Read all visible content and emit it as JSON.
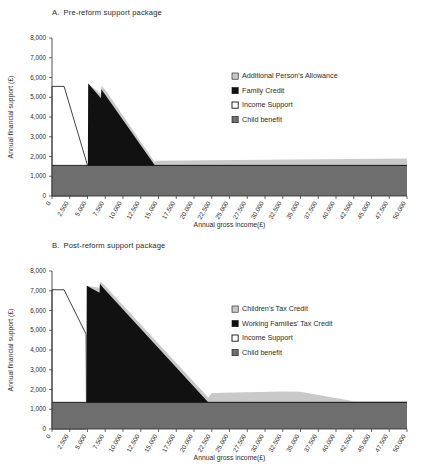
{
  "figure": {
    "width": 421,
    "height": 465,
    "background": "#ffffff"
  },
  "colors": {
    "top_band": "#c9c9c9",
    "main_band": "#111111",
    "income_support": "#ffffff",
    "child_benefit": "#6e6e6e",
    "axis": "#2b2b2b",
    "text": "#2b2b2b",
    "outline": "#111111"
  },
  "panels": [
    {
      "id": "a",
      "letter": "A.",
      "title": "Pre-reform support package",
      "legend": [
        {
          "label": "Additional Person's Allowance",
          "swatch": "#c9c9c9",
          "style": "filled"
        },
        {
          "label": "Family Credit",
          "swatch": "#111111",
          "style": "filled"
        },
        {
          "label": "Income Support",
          "swatch": "#ffffff",
          "style": "outlined"
        },
        {
          "label": "Child benefit",
          "swatch": "#6e6e6e",
          "style": "filled"
        }
      ],
      "chart_data": {
        "type": "area",
        "title": "A. Pre-reform support package",
        "xlabel": "Annual gross income(£)",
        "ylabel": "Annual financial support (£)",
        "xlim": [
          0,
          50000
        ],
        "ylim": [
          0,
          8000
        ],
        "grid": false,
        "legend_position": "right-inside",
        "xticks": [
          0,
          2500,
          5000,
          7500,
          10000,
          12500,
          15000,
          17500,
          20000,
          22500,
          25000,
          27500,
          30000,
          32500,
          35000,
          37500,
          40000,
          42500,
          45000,
          47500,
          50000
        ],
        "xticklabels": [
          "0",
          "2,500",
          "5,000",
          "7,500",
          "10,000",
          "12,500",
          "15,000",
          "17,500",
          "20,000",
          "22,500",
          "25,000",
          "27,500",
          "30,000",
          "32,500",
          "35,000",
          "37,500",
          "40,000",
          "42,500",
          "45,000",
          "47,500",
          "50,000"
        ],
        "yticks": [
          0,
          1000,
          2000,
          3000,
          4000,
          5000,
          6000,
          7000,
          8000
        ],
        "yticklabels": [
          "0",
          "1,000",
          "2,000",
          "3,000",
          "4,000",
          "5,000",
          "6,000",
          "7,000",
          "8,000"
        ],
        "series": [
          {
            "name": "Child benefit",
            "color": "#6e6e6e",
            "x": [
              0,
              50000
            ],
            "values": [
              1550,
              1550
            ]
          },
          {
            "name": "Income Support",
            "color": "#ffffff",
            "x": [
              0,
              1700,
              5000,
              5050
            ],
            "values": [
              5550,
              5550,
              1550,
              1550
            ]
          },
          {
            "name": "Family Credit",
            "color": "#111111",
            "x": [
              5050,
              5100,
              6900,
              6950,
              7450,
              14500,
              50000
            ],
            "values": [
              1550,
              5700,
              4950,
              5400,
              5150,
              1550,
              1550
            ]
          },
          {
            "name": "Additional Person's Allowance",
            "color": "#c9c9c9",
            "x": [
              5100,
              6900,
              6950,
              7450,
              14500,
              14600,
              50000
            ],
            "values": [
              5700,
              5150,
              5600,
              5400,
              1700,
              1780,
              1900
            ]
          }
        ]
      }
    },
    {
      "id": "b",
      "letter": "B.",
      "title": "Post-reform support package",
      "legend": [
        {
          "label": "Children's Tax Credit",
          "swatch": "#c9c9c9",
          "style": "filled"
        },
        {
          "label": "Working Families' Tax Credit",
          "swatch": "#111111",
          "style": "filled"
        },
        {
          "label": "Income Support",
          "swatch": "#ffffff",
          "style": "outlined"
        },
        {
          "label": "Child benefit",
          "swatch": "#6e6e6e",
          "style": "filled"
        }
      ],
      "chart_data": {
        "type": "area",
        "title": "B. Post-reform support package",
        "xlabel": "Annual gross income(£)",
        "ylabel": "Annual financial support (£)",
        "xlim": [
          0,
          50000
        ],
        "ylim": [
          0,
          8000
        ],
        "grid": false,
        "legend_position": "right-inside",
        "xticks": [
          0,
          2500,
          5000,
          7500,
          10000,
          12500,
          15000,
          17500,
          20000,
          22500,
          25000,
          27500,
          30000,
          32500,
          35000,
          37500,
          40000,
          42500,
          45000,
          47500,
          50000
        ],
        "xticklabels": [
          "0",
          "2,500",
          "5,000",
          "7,500",
          "10,000",
          "12,500",
          "15,000",
          "17,500",
          "20,000",
          "22,500",
          "25,000",
          "27,500",
          "30,000",
          "32,500",
          "35,000",
          "37,500",
          "40,000",
          "42,500",
          "45,000",
          "47,500",
          "50,000"
        ],
        "yticks": [
          0,
          1000,
          2000,
          3000,
          4000,
          5000,
          6000,
          7000,
          8000
        ],
        "yticklabels": [
          "0",
          "1,000",
          "2,000",
          "3,000",
          "4,000",
          "5,000",
          "6,000",
          "7,000",
          "8,000"
        ],
        "series": [
          {
            "name": "Child benefit",
            "color": "#6e6e6e",
            "x": [
              0,
              50000
            ],
            "values": [
              1350,
              1350
            ]
          },
          {
            "name": "Income Support",
            "color": "#ffffff",
            "x": [
              0,
              1700,
              4800,
              4850
            ],
            "values": [
              7050,
              7050,
              4800,
              1350
            ]
          },
          {
            "name": "Working Families' Tax Credit",
            "color": "#111111",
            "x": [
              4850,
              4900,
              6700,
              6750,
              7200,
              22000,
              50000
            ],
            "values": [
              1350,
              7250,
              6900,
              7350,
              7150,
              1350,
              1350
            ]
          },
          {
            "name": "Children's Tax Credit",
            "color": "#c9c9c9",
            "x": [
              4900,
              6700,
              6750,
              7200,
              22000,
              22500,
              32500,
              35000,
              42500,
              50000
            ],
            "values": [
              7250,
              7150,
              7450,
              7350,
              1600,
              1820,
              1900,
              1880,
              1400,
              1400
            ]
          }
        ]
      }
    }
  ]
}
